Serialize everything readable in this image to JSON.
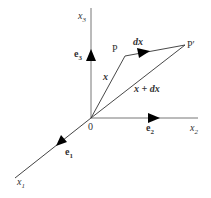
{
  "diagram": {
    "axes": {
      "x1": {
        "label": "x",
        "sub": "1",
        "unit_label": "e",
        "unit_sub": "1"
      },
      "x2": {
        "label": "x",
        "sub": "2",
        "unit_label": "e",
        "unit_sub": "2"
      },
      "x3": {
        "label": "x",
        "sub": "3",
        "unit_label": "e",
        "unit_sub": "3"
      }
    },
    "origin_label": "0",
    "points": {
      "P": "P",
      "P_prime": "P′"
    },
    "vectors": {
      "x": "x",
      "dx": "dx",
      "x_plus_dx": "x + dx"
    },
    "colors": {
      "axis": "#777777",
      "vector": "#333333",
      "arrow": "#000000"
    }
  }
}
